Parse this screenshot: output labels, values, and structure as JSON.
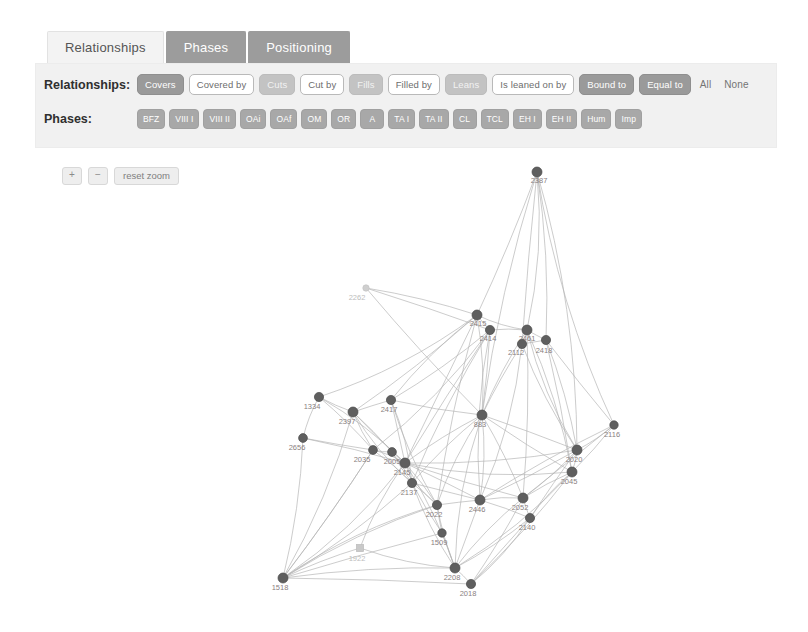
{
  "tabs": [
    {
      "label": "Relationships",
      "active": true
    },
    {
      "label": "Phases",
      "active": false
    },
    {
      "label": "Positioning",
      "active": false
    }
  ],
  "filters": {
    "relationships_label": "Relationships:",
    "relationships": [
      {
        "label": "Covers",
        "state": "on"
      },
      {
        "label": "Covered by",
        "state": "off"
      },
      {
        "label": "Cuts",
        "state": "dim"
      },
      {
        "label": "Cut by",
        "state": "off"
      },
      {
        "label": "Fills",
        "state": "dim"
      },
      {
        "label": "Filled by",
        "state": "off"
      },
      {
        "label": "Leans",
        "state": "dim"
      },
      {
        "label": "Is leaned on by",
        "state": "off"
      },
      {
        "label": "Bound to",
        "state": "on"
      },
      {
        "label": "Equal to",
        "state": "on"
      }
    ],
    "select_all": "All",
    "select_none": "None",
    "phases_label": "Phases:",
    "phases": [
      "BFZ",
      "VIII I",
      "VIII II",
      "OAi",
      "OAf",
      "OM",
      "OR",
      "A",
      "TA I",
      "TA II",
      "CL",
      "TCL",
      "EH I",
      "EH II",
      "Hum",
      "Imp"
    ]
  },
  "zoom_controls": {
    "zoom_in": "+",
    "zoom_out": "−",
    "reset": "reset zoom"
  },
  "colors": {
    "tab_active_bg": "#f3f3f3",
    "tab_inactive_bg": "#9c9c9c",
    "panel_bg": "#f1f1f1",
    "chip_on": "#9a9a9a",
    "node_fill": "#5f5f5f",
    "edge_stroke": "#b4b4b4"
  },
  "chart_data": {
    "type": "scatter",
    "title": "",
    "xlabel": "",
    "ylabel": "",
    "nodes": [
      {
        "id": "2387",
        "x": 537,
        "y": 22,
        "r": 5.0,
        "label_dx": 2,
        "label_dy": 11,
        "kind": "circle"
      },
      {
        "id": "2262",
        "x": 366,
        "y": 138,
        "r": 3.2,
        "label_dx": -9,
        "label_dy": 12,
        "kind": "ghost"
      },
      {
        "id": "2415",
        "x": 477,
        "y": 165,
        "r": 5.0,
        "label_dx": 1,
        "label_dy": 11,
        "kind": "circle"
      },
      {
        "id": "2414",
        "x": 490,
        "y": 180,
        "r": 4.6,
        "label_dx": -2,
        "label_dy": 11,
        "kind": "circle"
      },
      {
        "id": "2461",
        "x": 527,
        "y": 180,
        "r": 5.0,
        "label_dx": 0,
        "label_dy": 11,
        "kind": "circle"
      },
      {
        "id": "2112",
        "x": 522,
        "y": 194,
        "r": 4.6,
        "label_dx": -6,
        "label_dy": 11,
        "kind": "circle"
      },
      {
        "id": "2418",
        "x": 546,
        "y": 190,
        "r": 4.6,
        "label_dx": -2,
        "label_dy": 13,
        "kind": "circle"
      },
      {
        "id": "1334",
        "x": 319,
        "y": 247,
        "r": 4.6,
        "label_dx": -7,
        "label_dy": 12,
        "kind": "circle"
      },
      {
        "id": "2397",
        "x": 353,
        "y": 262,
        "r": 5.0,
        "label_dx": -6,
        "label_dy": 12,
        "kind": "circle"
      },
      {
        "id": "2417",
        "x": 391,
        "y": 250,
        "r": 4.6,
        "label_dx": -2,
        "label_dy": 12,
        "kind": "circle"
      },
      {
        "id": "2656",
        "x": 303,
        "y": 288,
        "r": 4.4,
        "label_dx": -6,
        "label_dy": 12,
        "kind": "circle"
      },
      {
        "id": "883",
        "x": 482,
        "y": 265,
        "r": 5.0,
        "label_dx": -2,
        "label_dy": 12,
        "kind": "circle"
      },
      {
        "id": "2116",
        "x": 614,
        "y": 275,
        "r": 4.2,
        "label_dx": -2,
        "label_dy": 12,
        "kind": "circle"
      },
      {
        "id": "2035",
        "x": 373,
        "y": 300,
        "r": 4.4,
        "label_dx": -11,
        "label_dy": 12,
        "kind": "circle"
      },
      {
        "id": "2005",
        "x": 392,
        "y": 302,
        "r": 4.4,
        "label_dx": 0,
        "label_dy": 12,
        "kind": "circle"
      },
      {
        "id": "2145",
        "x": 405,
        "y": 313,
        "r": 5.0,
        "label_dx": -3,
        "label_dy": 12,
        "kind": "circle"
      },
      {
        "id": "2137",
        "x": 412,
        "y": 333,
        "r": 4.6,
        "label_dx": -3,
        "label_dy": 12,
        "kind": "circle"
      },
      {
        "id": "2020",
        "x": 577,
        "y": 300,
        "r": 5.0,
        "label_dx": -3,
        "label_dy": 12,
        "kind": "circle"
      },
      {
        "id": "2045",
        "x": 572,
        "y": 322,
        "r": 5.0,
        "label_dx": -3,
        "label_dy": 12,
        "kind": "circle"
      },
      {
        "id": "2022",
        "x": 437,
        "y": 355,
        "r": 4.6,
        "label_dx": -3,
        "label_dy": 12,
        "kind": "circle"
      },
      {
        "id": "2446",
        "x": 480,
        "y": 350,
        "r": 5.0,
        "label_dx": -3,
        "label_dy": 12,
        "kind": "circle"
      },
      {
        "id": "2052",
        "x": 523,
        "y": 348,
        "r": 5.0,
        "label_dx": -3,
        "label_dy": 12,
        "kind": "circle"
      },
      {
        "id": "2140",
        "x": 530,
        "y": 368,
        "r": 4.6,
        "label_dx": -3,
        "label_dy": 12,
        "kind": "circle"
      },
      {
        "id": "1509",
        "x": 442,
        "y": 383,
        "r": 4.2,
        "label_dx": -3,
        "label_dy": 12,
        "kind": "circle"
      },
      {
        "id": "1922",
        "x": 360,
        "y": 398,
        "r": 3.6,
        "label_dx": -3,
        "label_dy": 13,
        "kind": "square"
      },
      {
        "id": "1518",
        "x": 283,
        "y": 428,
        "r": 5.0,
        "label_dx": -3,
        "label_dy": 12,
        "kind": "circle"
      },
      {
        "id": "2208",
        "x": 455,
        "y": 418,
        "r": 5.0,
        "label_dx": -3,
        "label_dy": 12,
        "kind": "circle"
      },
      {
        "id": "2018",
        "x": 471,
        "y": 434,
        "r": 4.6,
        "label_dx": -3,
        "label_dy": 12,
        "kind": "circle"
      }
    ],
    "edges": [
      [
        "2387",
        "2461",
        "c"
      ],
      [
        "2387",
        "2418",
        "c"
      ],
      [
        "2387",
        "2415",
        "c"
      ],
      [
        "2387",
        "2112",
        "c"
      ],
      [
        "2387",
        "883",
        "c"
      ],
      [
        "2387",
        "2116",
        "c"
      ],
      [
        "2387",
        "2020",
        "c"
      ],
      [
        "2262",
        "2415",
        "l"
      ],
      [
        "2262",
        "2414",
        "l"
      ],
      [
        "2262",
        "883",
        "l"
      ],
      [
        "2415",
        "2414",
        "c"
      ],
      [
        "2415",
        "2461",
        "c"
      ],
      [
        "2415",
        "883",
        "c"
      ],
      [
        "2415",
        "2397",
        "c"
      ],
      [
        "2415",
        "2145",
        "c"
      ],
      [
        "2415",
        "2022",
        "c"
      ],
      [
        "2415",
        "2417",
        "c"
      ],
      [
        "2415",
        "1334",
        "c"
      ],
      [
        "2414",
        "2461",
        "c"
      ],
      [
        "2414",
        "883",
        "c"
      ],
      [
        "2414",
        "2145",
        "c"
      ],
      [
        "2414",
        "2137",
        "c"
      ],
      [
        "2414",
        "2446",
        "c"
      ],
      [
        "2414",
        "2035",
        "c"
      ],
      [
        "2414",
        "2417",
        "c"
      ],
      [
        "2461",
        "2112",
        "c"
      ],
      [
        "2461",
        "2418",
        "c"
      ],
      [
        "2461",
        "883",
        "c"
      ],
      [
        "2461",
        "2020",
        "c"
      ],
      [
        "2461",
        "2045",
        "c"
      ],
      [
        "2461",
        "2052",
        "c"
      ],
      [
        "2112",
        "2418",
        "c"
      ],
      [
        "2112",
        "883",
        "c"
      ],
      [
        "2112",
        "2020",
        "c"
      ],
      [
        "2112",
        "2446",
        "c"
      ],
      [
        "2418",
        "2020",
        "c"
      ],
      [
        "2418",
        "2045",
        "c"
      ],
      [
        "2418",
        "2116",
        "c"
      ],
      [
        "1334",
        "2397",
        "c"
      ],
      [
        "1334",
        "2656",
        "c"
      ],
      [
        "1334",
        "2145",
        "c"
      ],
      [
        "1334",
        "2035",
        "c"
      ],
      [
        "2397",
        "2417",
        "c"
      ],
      [
        "2397",
        "2145",
        "c"
      ],
      [
        "2397",
        "2035",
        "c"
      ],
      [
        "2397",
        "2137",
        "c"
      ],
      [
        "2397",
        "1518",
        "c"
      ],
      [
        "2397",
        "2005",
        "c"
      ],
      [
        "2417",
        "2145",
        "c"
      ],
      [
        "2417",
        "883",
        "c"
      ],
      [
        "2417",
        "2022",
        "c"
      ],
      [
        "2417",
        "2137",
        "c"
      ],
      [
        "2656",
        "1518",
        "c"
      ],
      [
        "2656",
        "2145",
        "c"
      ],
      [
        "2656",
        "2035",
        "c"
      ],
      [
        "883",
        "2145",
        "c"
      ],
      [
        "883",
        "2022",
        "c"
      ],
      [
        "883",
        "2446",
        "c"
      ],
      [
        "883",
        "2052",
        "c"
      ],
      [
        "883",
        "2020",
        "c"
      ],
      [
        "883",
        "2045",
        "c"
      ],
      [
        "883",
        "2137",
        "c"
      ],
      [
        "883",
        "2208",
        "c"
      ],
      [
        "2116",
        "2020",
        "c"
      ],
      [
        "2116",
        "2045",
        "c"
      ],
      [
        "2116",
        "2052",
        "c"
      ],
      [
        "2116",
        "2446",
        "c"
      ],
      [
        "2035",
        "2005",
        "c"
      ],
      [
        "2035",
        "2145",
        "c"
      ],
      [
        "2035",
        "2137",
        "c"
      ],
      [
        "2035",
        "1518",
        "c"
      ],
      [
        "2005",
        "2145",
        "c"
      ],
      [
        "2005",
        "2137",
        "c"
      ],
      [
        "2005",
        "2022",
        "c"
      ],
      [
        "2145",
        "2137",
        "c"
      ],
      [
        "2145",
        "2022",
        "c"
      ],
      [
        "2145",
        "2446",
        "c"
      ],
      [
        "2145",
        "2052",
        "c"
      ],
      [
        "2145",
        "2020",
        "c"
      ],
      [
        "2145",
        "2045",
        "c"
      ],
      [
        "2145",
        "2208",
        "c"
      ],
      [
        "2137",
        "2022",
        "c"
      ],
      [
        "2137",
        "2446",
        "c"
      ],
      [
        "2137",
        "1509",
        "c"
      ],
      [
        "2137",
        "2208",
        "c"
      ],
      [
        "2020",
        "2045",
        "c"
      ],
      [
        "2020",
        "2052",
        "c"
      ],
      [
        "2020",
        "2446",
        "c"
      ],
      [
        "2020",
        "2140",
        "c"
      ],
      [
        "2045",
        "2052",
        "c"
      ],
      [
        "2045",
        "2140",
        "c"
      ],
      [
        "2045",
        "2208",
        "c"
      ],
      [
        "2045",
        "2018",
        "c"
      ],
      [
        "2022",
        "2446",
        "c"
      ],
      [
        "2022",
        "1509",
        "c"
      ],
      [
        "2022",
        "2208",
        "c"
      ],
      [
        "2022",
        "1518",
        "c"
      ],
      [
        "2446",
        "2052",
        "c"
      ],
      [
        "2446",
        "2140",
        "c"
      ],
      [
        "2446",
        "2208",
        "c"
      ],
      [
        "2052",
        "2140",
        "c"
      ],
      [
        "2052",
        "2208",
        "c"
      ],
      [
        "2140",
        "2018",
        "c"
      ],
      [
        "2140",
        "2208",
        "c"
      ],
      [
        "1509",
        "2208",
        "c"
      ],
      [
        "1509",
        "1518",
        "c"
      ],
      [
        "1922",
        "1518",
        "c"
      ],
      [
        "1922",
        "2208",
        "c"
      ],
      [
        "1922",
        "2145",
        "c"
      ],
      [
        "1518",
        "2208",
        "c"
      ],
      [
        "1518",
        "2018",
        "c"
      ],
      [
        "1518",
        "2035",
        "c"
      ],
      [
        "1518",
        "2137",
        "c"
      ],
      [
        "1518",
        "2145",
        "c"
      ],
      [
        "1518",
        "2022",
        "c"
      ],
      [
        "2208",
        "2018",
        "c"
      ],
      [
        "2018",
        "2140",
        "c"
      ],
      [
        "2018",
        "2052",
        "c"
      ]
    ]
  }
}
